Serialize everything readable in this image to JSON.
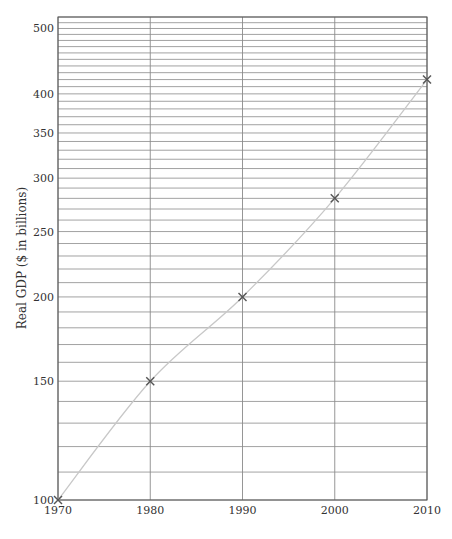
{
  "chart_data": {
    "type": "line",
    "title": "",
    "xlabel": "",
    "ylabel": "Real GDP ($ in billions)",
    "yscale": "log",
    "x": [
      1970,
      1980,
      1990,
      2000,
      2010
    ],
    "series": [
      {
        "name": "Real GDP",
        "values": [
          100,
          150,
          200,
          280,
          420
        ]
      }
    ],
    "xticks": [
      "1970",
      "1980",
      "1990",
      "2000",
      "2010"
    ],
    "yticks": [
      "100",
      "150",
      "200",
      "250",
      "300",
      "350",
      "400",
      "500"
    ],
    "xlim": [
      1970,
      2010
    ],
    "ylim": [
      100,
      520
    ],
    "grid": true,
    "minor_grid_step": 10,
    "legend": null,
    "colors": {
      "line": "#c8c8c8",
      "marker": "#555555",
      "grid": "#8a8a8a",
      "frame": "#555555"
    }
  }
}
